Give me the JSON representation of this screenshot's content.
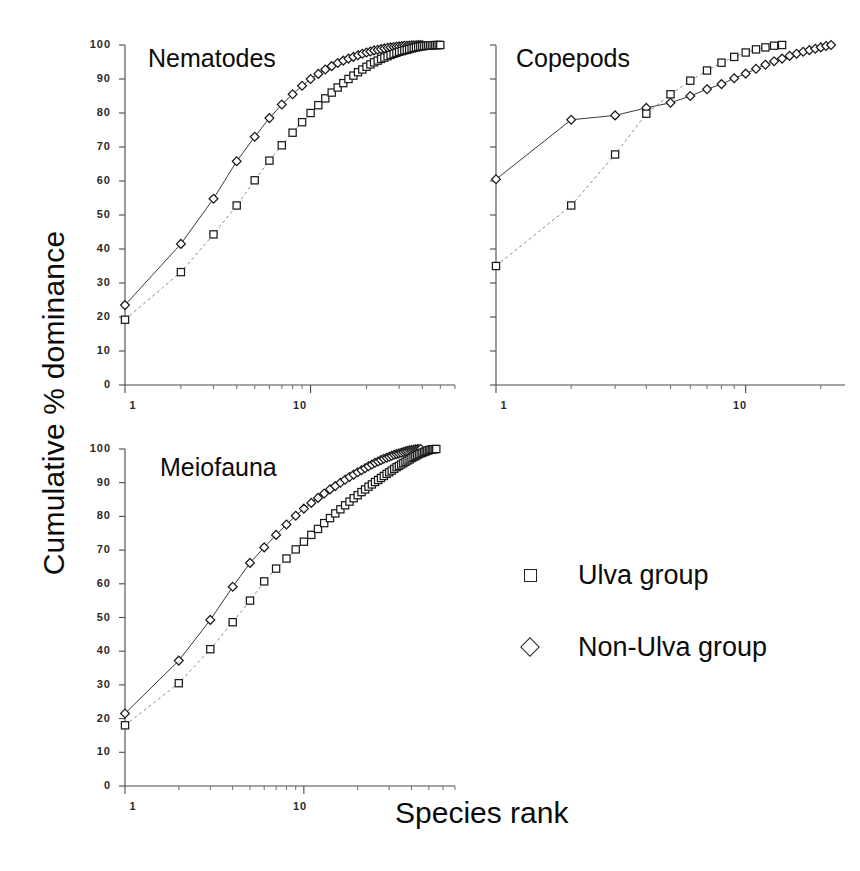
{
  "figure": {
    "ylabel": "Cumulative % dominance",
    "xlabel": "Species rank"
  },
  "legend": {
    "items": [
      {
        "label": "Ulva group",
        "marker": "square"
      },
      {
        "label": "Non-Ulva group",
        "marker": "diamond"
      }
    ]
  },
  "panels": {
    "nematodes": {
      "title": "Nematodes"
    },
    "copepods": {
      "title": "Copepods"
    },
    "meiofauna": {
      "title": "Meiofauna"
    }
  },
  "axis_labels": {
    "y_ticks": [
      "0",
      "10",
      "20",
      "30",
      "40",
      "50",
      "60",
      "70",
      "80",
      "90",
      "100"
    ],
    "x_ticks": [
      "1",
      "10"
    ]
  },
  "chart_data": [
    {
      "id": "nematodes",
      "type": "line",
      "title": "Nematodes",
      "xlabel": "Species rank",
      "ylabel": "Cumulative % dominance",
      "xscale": "log",
      "xlim": [
        1,
        60
      ],
      "ylim": [
        0,
        100
      ],
      "grid": false,
      "y_ticks": [
        0,
        10,
        20,
        30,
        40,
        50,
        60,
        70,
        80,
        90,
        100
      ],
      "x_ticks": [
        1,
        10
      ],
      "legend_position": "outside-lower-right",
      "series": [
        {
          "name": "Non-Ulva group",
          "marker": "diamond",
          "linestyle": "solid",
          "x": [
            1,
            2,
            3,
            4,
            5,
            6,
            7,
            8,
            9,
            10,
            11,
            12,
            13,
            14,
            15,
            16,
            17,
            18,
            19,
            20,
            21,
            22,
            23,
            24,
            25,
            26,
            27,
            28,
            29,
            30,
            31,
            32,
            33,
            34,
            35,
            36,
            37,
            38,
            39,
            40
          ],
          "y": [
            23.5,
            41.5,
            54.8,
            65.8,
            73.0,
            78.5,
            82.5,
            85.5,
            88.0,
            90.0,
            91.5,
            92.8,
            93.8,
            94.7,
            95.4,
            96.0,
            96.5,
            97.0,
            97.4,
            97.8,
            98.1,
            98.4,
            98.6,
            98.8,
            99.0,
            99.2,
            99.3,
            99.4,
            99.5,
            99.6,
            99.7,
            99.75,
            99.8,
            99.85,
            99.9,
            99.92,
            99.95,
            99.97,
            99.99,
            100.0
          ]
        },
        {
          "name": "Ulva group",
          "marker": "square",
          "linestyle": "dashed",
          "x": [
            1,
            2,
            3,
            4,
            5,
            6,
            7,
            8,
            9,
            10,
            11,
            12,
            13,
            14,
            15,
            16,
            17,
            18,
            19,
            20,
            21,
            22,
            23,
            24,
            25,
            26,
            27,
            28,
            29,
            30,
            31,
            32,
            33,
            34,
            35,
            36,
            37,
            38,
            39,
            40,
            41,
            42,
            43,
            44,
            45,
            46,
            47,
            48,
            49,
            50
          ],
          "y": [
            19.2,
            33.2,
            44.3,
            52.8,
            60.2,
            66.0,
            70.5,
            74.2,
            77.3,
            80.0,
            82.3,
            84.3,
            86.0,
            87.5,
            88.8,
            90.0,
            91.0,
            92.0,
            92.8,
            93.6,
            94.3,
            94.9,
            95.4,
            95.9,
            96.3,
            96.7,
            97.1,
            97.4,
            97.7,
            98.0,
            98.2,
            98.4,
            98.6,
            98.8,
            99.0,
            99.15,
            99.3,
            99.45,
            99.55,
            99.65,
            99.72,
            99.78,
            99.84,
            99.88,
            99.92,
            99.95,
            99.97,
            99.98,
            99.99,
            100.0
          ]
        }
      ]
    },
    {
      "id": "copepods",
      "type": "line",
      "title": "Copepods",
      "xlabel": "Species rank",
      "ylabel": "Cumulative % dominance",
      "xscale": "log",
      "xlim": [
        1,
        25
      ],
      "ylim": [
        0,
        100
      ],
      "grid": false,
      "y_ticks": [
        0,
        10,
        20,
        30,
        40,
        50,
        60,
        70,
        80,
        90,
        100
      ],
      "x_ticks": [
        1,
        10
      ],
      "legend_position": "outside-lower-right",
      "series": [
        {
          "name": "Non-Ulva group",
          "marker": "diamond",
          "linestyle": "solid",
          "x": [
            1,
            2,
            3,
            4,
            5,
            6,
            7,
            8,
            9,
            10,
            11,
            12,
            13,
            14,
            15,
            16,
            17,
            18,
            19,
            20,
            21,
            22
          ],
          "y": [
            60.5,
            78.0,
            79.3,
            81.5,
            83.0,
            85.0,
            87.0,
            88.5,
            90.2,
            91.6,
            93.0,
            94.2,
            95.2,
            96.0,
            96.8,
            97.4,
            98.0,
            98.5,
            98.9,
            99.3,
            99.7,
            100.0
          ]
        },
        {
          "name": "Ulva group",
          "marker": "square",
          "linestyle": "dashed",
          "x": [
            1,
            2,
            3,
            4,
            5,
            6,
            7,
            8,
            9,
            10,
            11,
            12,
            13,
            14
          ],
          "y": [
            35.0,
            52.8,
            67.8,
            79.8,
            85.5,
            89.5,
            92.5,
            94.8,
            96.5,
            97.8,
            98.7,
            99.3,
            99.8,
            100.0
          ]
        }
      ]
    },
    {
      "id": "meiofauna",
      "type": "line",
      "title": "Meiofauna",
      "xlabel": "Species rank",
      "ylabel": "Cumulative % dominance",
      "xscale": "log",
      "xlim": [
        1,
        70
      ],
      "ylim": [
        0,
        100
      ],
      "grid": false,
      "y_ticks": [
        0,
        10,
        20,
        30,
        40,
        50,
        60,
        70,
        80,
        90,
        100
      ],
      "x_ticks": [
        1,
        10
      ],
      "legend_position": "outside-right",
      "series": [
        {
          "name": "Non-Ulva group",
          "marker": "diamond",
          "linestyle": "solid",
          "x": [
            1,
            2,
            3,
            4,
            5,
            6,
            7,
            8,
            9,
            10,
            11,
            12,
            13,
            14,
            15,
            16,
            17,
            18,
            19,
            20,
            21,
            22,
            23,
            24,
            25,
            26,
            27,
            28,
            29,
            30,
            31,
            32,
            33,
            34,
            35,
            36,
            37,
            38,
            39,
            40,
            41,
            42,
            43,
            44,
            45
          ],
          "y": [
            21.5,
            37.2,
            49.3,
            59.1,
            66.2,
            70.8,
            74.5,
            77.6,
            80.2,
            82.3,
            84.0,
            85.5,
            86.8,
            88.0,
            89.0,
            90.0,
            90.9,
            91.7,
            92.4,
            93.1,
            93.7,
            94.3,
            94.9,
            95.4,
            95.9,
            96.3,
            96.7,
            97.1,
            97.4,
            97.7,
            98.0,
            98.3,
            98.5,
            98.7,
            98.9,
            99.1,
            99.3,
            99.45,
            99.6,
            99.7,
            99.8,
            99.88,
            99.93,
            99.97,
            100.0
          ]
        },
        {
          "name": "Ulva group",
          "marker": "square",
          "linestyle": "dashed",
          "x": [
            1,
            2,
            3,
            4,
            5,
            6,
            7,
            8,
            9,
            10,
            11,
            12,
            13,
            14,
            15,
            16,
            17,
            18,
            19,
            20,
            21,
            22,
            23,
            24,
            25,
            26,
            27,
            28,
            29,
            30,
            31,
            32,
            33,
            34,
            35,
            36,
            37,
            38,
            39,
            40,
            41,
            42,
            43,
            44,
            45,
            46,
            47,
            48,
            49,
            50,
            51,
            52,
            53,
            54,
            55
          ],
          "y": [
            18.0,
            30.5,
            40.6,
            48.6,
            55.0,
            60.7,
            64.5,
            67.5,
            70.2,
            72.5,
            74.5,
            76.3,
            78.0,
            79.5,
            80.9,
            82.1,
            83.3,
            84.4,
            85.4,
            86.3,
            87.2,
            88.0,
            88.8,
            89.5,
            90.2,
            90.8,
            91.4,
            92.0,
            92.6,
            93.1,
            93.6,
            94.1,
            94.6,
            95.0,
            95.4,
            95.8,
            96.2,
            96.6,
            96.9,
            97.3,
            97.6,
            97.9,
            98.2,
            98.5,
            98.7,
            98.9,
            99.1,
            99.3,
            99.5,
            99.65,
            99.78,
            99.87,
            99.93,
            99.97,
            100.0
          ]
        }
      ]
    }
  ]
}
